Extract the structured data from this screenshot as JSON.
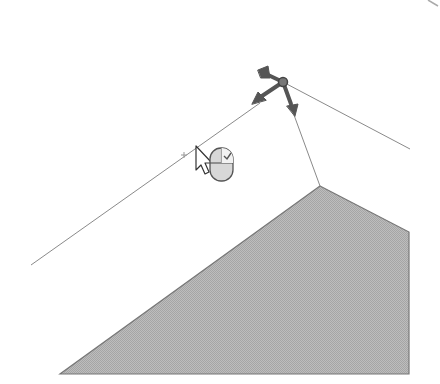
{
  "scene": {
    "description": "3D modeling viewport with a gizmo (move/manipulator) on a vertex, wireframe edges and a shaded face",
    "colors": {
      "background": "#ffffff",
      "edge": "#7a7a7a",
      "face_fill": "#b4b4b4",
      "gizmo": "#555555",
      "cursor": "#333333"
    },
    "vertex": {
      "x": 283,
      "y": 82
    },
    "cursor": {
      "x": 196,
      "y": 146
    },
    "hint_icon": "mouse-left-click-icon"
  }
}
